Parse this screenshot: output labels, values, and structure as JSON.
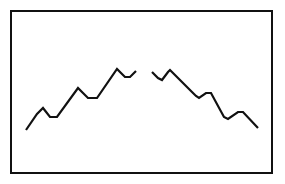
{
  "figure": {
    "title": "",
    "background_color": "#ffffff",
    "canvas": {
      "width": 285,
      "height": 184
    },
    "frame": {
      "label": "frame-border",
      "x": 11,
      "y": 11,
      "width": 261,
      "height": 162,
      "stroke_color": "#111111",
      "stroke_width": 2,
      "fill_color": "#ffffff"
    }
  },
  "chart_data": {
    "type": "line",
    "title": "",
    "xlabel": "",
    "ylabel": "",
    "grid": false,
    "legend": "none",
    "axis_visible": false,
    "xlim": [
      11,
      272
    ],
    "ylim": [
      173,
      11
    ],
    "stroke_color": "#111111",
    "stroke_width": 2.2,
    "series": [
      {
        "name": "ascending-zigzag",
        "points": [
          [
            26,
            130
          ],
          [
            37,
            114
          ],
          [
            43,
            108
          ],
          [
            50,
            117
          ],
          [
            57,
            117
          ],
          [
            78,
            88
          ],
          [
            83,
            93
          ],
          [
            88,
            98
          ],
          [
            97,
            98
          ],
          [
            117,
            69
          ],
          [
            121,
            73
          ],
          [
            125,
            77
          ],
          [
            130,
            77
          ],
          [
            136,
            71
          ]
        ]
      },
      {
        "name": "descending-zigzag",
        "points": [
          [
            152,
            72
          ],
          [
            158,
            78
          ],
          [
            162,
            80
          ],
          [
            168,
            72
          ],
          [
            170,
            70
          ],
          [
            192,
            92
          ],
          [
            196,
            96
          ],
          [
            199,
            98
          ],
          [
            206,
            93
          ],
          [
            211,
            93
          ],
          [
            224,
            117
          ],
          [
            228,
            119
          ],
          [
            238,
            112
          ],
          [
            243,
            112
          ],
          [
            258,
            128
          ]
        ]
      }
    ]
  }
}
